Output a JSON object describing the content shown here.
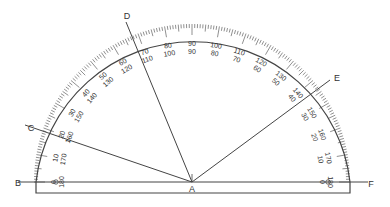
{
  "diagram": {
    "title": "",
    "type": "protractor",
    "center": {
      "label": "A",
      "x": 192,
      "y": 182
    },
    "radius": 158,
    "baseline": {
      "y": 182,
      "left_x": 18,
      "right_x": 368
    },
    "body": {
      "left_x": 36,
      "right_x": 350,
      "bottom_y": 193
    },
    "points": [
      {
        "label": "B",
        "x": 18,
        "y": 183
      },
      {
        "label": "C",
        "x": 31,
        "y": 128
      },
      {
        "label": "D",
        "x": 127,
        "y": 16
      },
      {
        "label": "E",
        "x": 337,
        "y": 78
      },
      {
        "label": "F",
        "x": 371,
        "y": 184
      },
      {
        "label": "A",
        "x": 192,
        "y": 189
      }
    ],
    "rays": [
      {
        "name": "ray-AC",
        "to_label": "C",
        "end": [
          25,
          125
        ],
        "angle_outer": 20,
        "angle_inner": 160
      },
      {
        "name": "ray-AD",
        "to_label": "D",
        "end": [
          126,
          22
        ],
        "angle_outer": 68,
        "angle_inner": 112
      },
      {
        "name": "ray-AE",
        "to_label": "E",
        "end": [
          330,
          80
        ],
        "angle_outer": 144,
        "angle_inner": 36
      }
    ],
    "outer_scale": [
      "0",
      "10",
      "20",
      "30",
      "40",
      "50",
      "60",
      "70",
      "80",
      "90",
      "100",
      "110",
      "120",
      "130",
      "140",
      "150",
      "160",
      "170",
      "180"
    ],
    "inner_scale": [
      "180",
      "170",
      "160",
      "150",
      "140",
      "130",
      "120",
      "110",
      "100",
      "90",
      "80",
      "70",
      "60",
      "50",
      "40",
      "30",
      "20",
      "10",
      "0"
    ],
    "stroke_color": "#444444",
    "text_color": "#333333"
  }
}
